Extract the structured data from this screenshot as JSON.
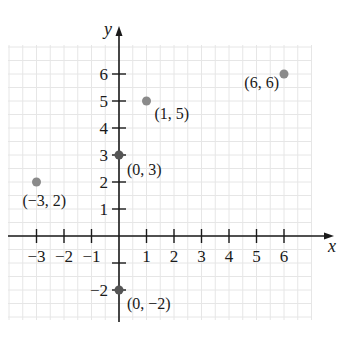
{
  "chart_data": {
    "type": "scatter",
    "title": "",
    "xlabel": "x",
    "ylabel": "y",
    "xlim": [
      -4,
      7
    ],
    "ylim": [
      -3,
      7
    ],
    "grid": true,
    "x_ticks": [
      -3,
      -2,
      -1,
      1,
      2,
      3,
      4,
      5,
      6
    ],
    "x_tick_labels": [
      "−3",
      "−2",
      "−1",
      "1",
      "2",
      "3",
      "4",
      "5",
      "6"
    ],
    "y_ticks": [
      -2,
      -1,
      1,
      2,
      3,
      4,
      5,
      6
    ],
    "y_tick_labels": [
      "−2",
      "",
      "1",
      "2",
      "3",
      "4",
      "5",
      "6"
    ],
    "points": [
      {
        "x": -3,
        "y": 2,
        "label": "(−3, 2)",
        "color": "#8a8a8a"
      },
      {
        "x": 0,
        "y": 3,
        "label": "(0, 3)",
        "color": "#555555"
      },
      {
        "x": 1,
        "y": 5,
        "label": "(1, 5)",
        "color": "#8a8a8a"
      },
      {
        "x": 6,
        "y": 6,
        "label": "(6, 6)",
        "color": "#8a8a8a"
      },
      {
        "x": 0,
        "y": -2,
        "label": "(0, −2)",
        "color": "#555555"
      }
    ]
  },
  "colors": {
    "axis": "#1a1a1a",
    "grid": "#e6e6e6",
    "point": "#8a8a8a"
  }
}
